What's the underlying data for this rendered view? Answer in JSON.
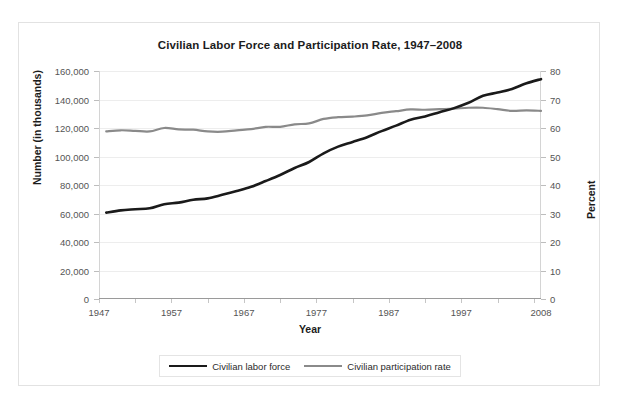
{
  "chart_data": {
    "type": "line",
    "title": "Civilian Labor Force and Participation Rate, 1947–2008",
    "xlabel": "Year",
    "ylabel": "Number (in thousands)",
    "ylabel_right": "Percent",
    "grid": true,
    "legend_position": "bottom",
    "xlim": [
      1947,
      2008
    ],
    "ylim": [
      0,
      160000
    ],
    "ylim_right": [
      0,
      80
    ],
    "xticks": [
      1947,
      1957,
      1967,
      1977,
      1987,
      1997,
      2008
    ],
    "xtick_labels": [
      "1947",
      "1957",
      "1967",
      "1977",
      "1987",
      "1997",
      "2008"
    ],
    "yticks": [
      0,
      20000,
      40000,
      60000,
      80000,
      100000,
      120000,
      140000,
      160000
    ],
    "ytick_labels": [
      "0",
      "20,000",
      "40,000",
      "60,000",
      "80,000",
      "100,000",
      "120,000",
      "140,000",
      "160,000"
    ],
    "yticks_right": [
      0,
      10,
      20,
      30,
      40,
      50,
      60,
      70,
      80
    ],
    "ytick_labels_right": [
      "0",
      "10",
      "20",
      "30",
      "40",
      "50",
      "60",
      "70",
      "80"
    ],
    "colors": {
      "labor_force": "#1a1a1a",
      "participation_rate": "#8a8a8a"
    },
    "x": [
      1948,
      1950,
      1952,
      1954,
      1956,
      1958,
      1960,
      1962,
      1964,
      1966,
      1968,
      1970,
      1972,
      1974,
      1976,
      1978,
      1980,
      1982,
      1984,
      1986,
      1988,
      1990,
      1992,
      1994,
      1996,
      1998,
      2000,
      2002,
      2004,
      2006,
      2008
    ],
    "series": [
      {
        "name": "Civilian labor force",
        "axis": "left",
        "unit": "thousands",
        "values": [
          60621,
          62208,
          62966,
          63643,
          66552,
          67639,
          69628,
          70614,
          73091,
          75770,
          78737,
          82771,
          87034,
          91949,
          96158,
          102251,
          106940,
          110204,
          113544,
          117834,
          121669,
          125840,
          128105,
          131056,
          133943,
          137673,
          142583,
          144863,
          147401,
          151428,
          154287
        ]
      },
      {
        "name": "Civilian participation rate",
        "axis": "right",
        "unit": "percent",
        "values": [
          58.8,
          59.2,
          59.0,
          58.8,
          60.0,
          59.5,
          59.4,
          58.8,
          58.7,
          59.2,
          59.6,
          60.4,
          60.4,
          61.3,
          61.6,
          63.2,
          63.8,
          64.0,
          64.4,
          65.3,
          65.9,
          66.5,
          66.4,
          66.6,
          66.8,
          67.1,
          67.1,
          66.6,
          66.0,
          66.2,
          66.0
        ]
      }
    ]
  },
  "legend": {
    "items": [
      {
        "label": "Civilian labor force",
        "color": "#1a1a1a"
      },
      {
        "label": "Civilian participation rate",
        "color": "#8a8a8a"
      }
    ]
  }
}
